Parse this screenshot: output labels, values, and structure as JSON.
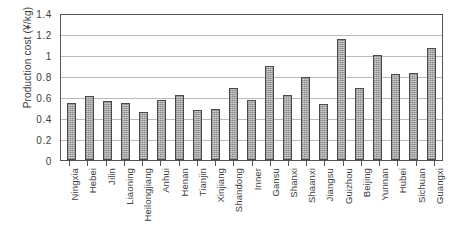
{
  "chart_data": {
    "type": "bar",
    "title": "",
    "xlabel": "",
    "ylabel": "Production cost (¥/kg)",
    "ylim": [
      0,
      1.4
    ],
    "yticks": [
      "0",
      "0.2",
      "0.4",
      "0.6",
      "0.8",
      "1",
      "1.2",
      "1.4"
    ],
    "ytick_values": [
      0,
      0.2,
      0.4,
      0.6,
      0.8,
      1,
      1.2,
      1.4
    ],
    "grid": "horizontal",
    "legend": "none",
    "categories": [
      "Ningxia",
      "Hebei",
      "Jilin",
      "Liaoning",
      "Heilongjiang",
      "Anhui",
      "Henan",
      "Tianjin",
      "Xinjiang",
      "Shandong",
      "Inner",
      "Gansu",
      "Shanxi",
      "Shaanxi",
      "Jiangsu",
      "Guizhou",
      "Beijing",
      "Yunnan",
      "Hubei",
      "Sichuan",
      "Guangxi"
    ],
    "values": [
      0.54,
      0.61,
      0.56,
      0.54,
      0.46,
      0.57,
      0.62,
      0.48,
      0.49,
      0.69,
      0.57,
      0.9,
      0.62,
      0.79,
      0.53,
      1.15,
      0.69,
      1.0,
      0.82,
      0.83,
      1.07
    ],
    "bar_fill_color": "#cfcfcf",
    "bar_edge_color": "#4a4a4a",
    "gridline_color": "#b9b9b9",
    "axis_color": "#555555"
  }
}
